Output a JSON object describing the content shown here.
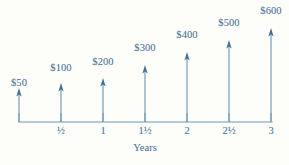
{
  "chart_data": {
    "type": "bar",
    "title": "",
    "subtitle": "",
    "xlabel": "Years",
    "ylabel": "",
    "grid": false,
    "legend": "none",
    "axis_color": "#6e9ab8",
    "text_color": "#4f7b9c",
    "background": "#fdfdfa",
    "xlim": [
      0,
      3
    ],
    "ylim": [
      0,
      600
    ],
    "x_ticks": [
      "0",
      "½",
      "1",
      "1½",
      "2",
      "2½",
      "3"
    ],
    "x_tick_values": [
      0,
      0.5,
      1,
      1.5,
      2,
      2.5,
      3
    ],
    "categories": [
      "0",
      "½",
      "1",
      "1½",
      "2",
      "2½",
      "3"
    ],
    "values": [
      50,
      100,
      200,
      300,
      400,
      500,
      600
    ],
    "data_labels": [
      "$50",
      "$100",
      "$200",
      "$300",
      "$400",
      "$500",
      "$600"
    ],
    "series": [
      {
        "name": "Cash flow",
        "values": [
          50,
          100,
          200,
          300,
          400,
          500,
          600
        ]
      }
    ],
    "arrows": [
      {
        "label": "$50",
        "x": 0,
        "value": 50,
        "px": 19,
        "tip_y": 88,
        "label_y": 77
      },
      {
        "label": "$100",
        "x": 0.5,
        "value": 100,
        "px": 61,
        "tip_y": 83,
        "label_y": 62
      },
      {
        "label": "$200",
        "x": 1,
        "value": 200,
        "px": 103,
        "tip_y": 78,
        "label_y": 56
      },
      {
        "label": "$300",
        "x": 1.5,
        "value": 300,
        "px": 145,
        "tip_y": 65,
        "label_y": 42
      },
      {
        "label": "$400",
        "x": 2,
        "value": 400,
        "px": 187,
        "tip_y": 52,
        "label_y": 29
      },
      {
        "label": "$500",
        "x": 2.5,
        "value": 500,
        "px": 229,
        "tip_y": 40,
        "label_y": 17
      },
      {
        "label": "$600",
        "x": 3,
        "value": 600,
        "px": 271,
        "tip_y": 28,
        "label_y": 5
      }
    ],
    "axis": {
      "y_px": 122,
      "x_start_px": 19,
      "x_end_px": 272,
      "tick_px": [
        19,
        61,
        103,
        145,
        187,
        229,
        271
      ],
      "tick_height": 9,
      "tick_label_y": 125
    },
    "xlabel_px": {
      "x": 145,
      "y": 142
    }
  }
}
